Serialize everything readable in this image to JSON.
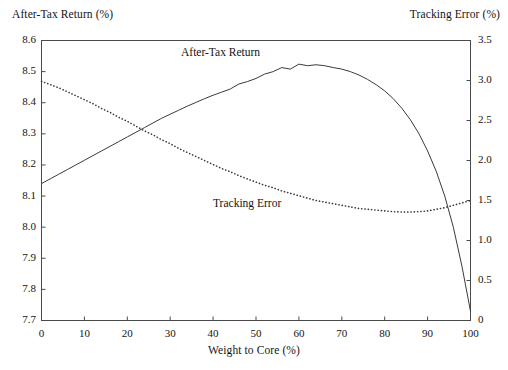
{
  "chart_data": {
    "type": "line",
    "title": "",
    "xlabel": "Weight to Core (%)",
    "ylabel": "After-Tax Return (%)",
    "ylabel_right": "Tracking Error (%)",
    "xlim": [
      0,
      100
    ],
    "ylim": [
      7.7,
      8.6
    ],
    "ylim_right": [
      0,
      3.5
    ],
    "grid": false,
    "legend_position": "inline-annotations",
    "xticks": [
      "0",
      "10",
      "20",
      "30",
      "40",
      "50",
      "60",
      "70",
      "80",
      "90",
      "100"
    ],
    "yticks_left": [
      "7.7",
      "7.8",
      "7.9",
      "8.0",
      "8.1",
      "8.2",
      "8.3",
      "8.4",
      "8.5",
      "8.6"
    ],
    "yticks_right": [
      "0",
      "0.5",
      "1.0",
      "1.5",
      "2.0",
      "2.5",
      "3.0",
      "3.5"
    ],
    "annotations": [
      "After-Tax Return",
      "Tracking Error"
    ],
    "x": [
      0,
      2,
      4,
      6,
      8,
      10,
      12,
      14,
      16,
      18,
      20,
      22,
      24,
      26,
      28,
      30,
      32,
      34,
      36,
      38,
      40,
      42,
      44,
      46,
      48,
      50,
      52,
      54,
      56,
      58,
      60,
      62,
      64,
      66,
      68,
      70,
      72,
      74,
      76,
      78,
      80,
      82,
      84,
      86,
      88,
      90,
      92,
      94,
      96,
      98,
      100
    ],
    "series": [
      {
        "name": "After-Tax Return",
        "axis": "left",
        "style": "solid",
        "values": [
          8.14,
          8.155,
          8.17,
          8.185,
          8.2,
          8.215,
          8.23,
          8.245,
          8.26,
          8.275,
          8.29,
          8.305,
          8.32,
          8.335,
          8.35,
          8.363,
          8.376,
          8.389,
          8.401,
          8.413,
          8.424,
          8.434,
          8.444,
          8.46,
          8.468,
          8.478,
          8.492,
          8.5,
          8.513,
          8.508,
          8.524,
          8.519,
          8.522,
          8.519,
          8.513,
          8.508,
          8.5,
          8.489,
          8.475,
          8.458,
          8.438,
          8.413,
          8.382,
          8.345,
          8.3,
          8.245,
          8.18,
          8.1,
          8.0,
          7.875,
          7.73
        ]
      },
      {
        "name": "Tracking Error",
        "axis": "right",
        "style": "dotted",
        "values": [
          2.99,
          2.95,
          2.91,
          2.86,
          2.81,
          2.76,
          2.71,
          2.65,
          2.6,
          2.54,
          2.49,
          2.43,
          2.37,
          2.32,
          2.26,
          2.21,
          2.15,
          2.1,
          2.05,
          2.0,
          1.95,
          1.9,
          1.86,
          1.81,
          1.77,
          1.73,
          1.69,
          1.66,
          1.62,
          1.59,
          1.56,
          1.53,
          1.5,
          1.48,
          1.46,
          1.44,
          1.42,
          1.4,
          1.39,
          1.38,
          1.37,
          1.36,
          1.355,
          1.355,
          1.36,
          1.37,
          1.39,
          1.41,
          1.44,
          1.47,
          1.5
        ]
      }
    ]
  },
  "axes": {
    "left_title": "After-Tax Return (%)",
    "right_title": "Tracking Error (%)",
    "x_title": "Weight to Core (%)"
  },
  "labels": {
    "after_tax_return": "After-Tax Return",
    "tracking_error": "Tracking Error"
  }
}
